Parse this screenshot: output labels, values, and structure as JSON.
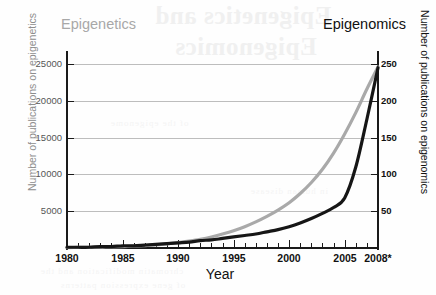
{
  "series_titles": {
    "left": "Epigenetics",
    "right": "Epigenomics"
  },
  "background_bleed": {
    "line1": "Epigenetics and",
    "line2": "Epigenomics",
    "smudge1": "of the epigenome",
    "smudge2": "in human disease",
    "bottom1": "chromatin modification and the",
    "bottom2": "of gene expression patterns"
  },
  "chart_data": {
    "type": "line",
    "title": "",
    "xlabel": "Year",
    "ylabel_left": "Number of publications on epigenetics",
    "ylabel_right": "Number of publications on epigenomics",
    "xlim": [
      1980,
      2008
    ],
    "ylim_left": [
      0,
      26500
    ],
    "ylim_right": [
      0,
      265
    ],
    "grid": true,
    "legend_position": "top-inline",
    "x_major_ticks": [
      1980,
      1985,
      1990,
      1995,
      2000,
      2005,
      2008
    ],
    "x_tick_labels": [
      "1980",
      "1985",
      "1990",
      "1995",
      "2000",
      "2005",
      "2008*"
    ],
    "x_minor_tick_step": 1,
    "y_left_ticks": [
      5000,
      10000,
      15000,
      20000,
      25000
    ],
    "y_left_tick_labels": [
      "5000",
      "10000",
      "15000",
      "20000",
      "25000"
    ],
    "y_right_ticks": [
      50,
      100,
      150,
      200,
      250
    ],
    "y_right_tick_labels": [
      "50",
      "100",
      "150",
      "200",
      "250"
    ],
    "x": [
      1980,
      1981,
      1982,
      1983,
      1984,
      1985,
      1986,
      1987,
      1988,
      1989,
      1990,
      1991,
      1992,
      1993,
      1994,
      1995,
      1996,
      1997,
      1998,
      1999,
      2000,
      2001,
      2002,
      2003,
      2004,
      2005,
      2006,
      2007,
      2008
    ],
    "series": [
      {
        "name": "Epigenetics",
        "axis": "left",
        "color": "#a9a9a9",
        "values": [
          60,
          75,
          95,
          120,
          150,
          190,
          250,
          330,
          430,
          560,
          720,
          930,
          1180,
          1500,
          1900,
          2350,
          2900,
          3550,
          4300,
          5150,
          6150,
          7400,
          8900,
          10700,
          12900,
          15500,
          18400,
          21600,
          24600
        ]
      },
      {
        "name": "Epigenomics",
        "axis": "right",
        "color": "#161616",
        "values": [
          1,
          1,
          1,
          2,
          2,
          3,
          3,
          4,
          5,
          6,
          7,
          8,
          10,
          11,
          13,
          15,
          17,
          19,
          22,
          25,
          29,
          34,
          40,
          47,
          55,
          68,
          110,
          175,
          245
        ]
      }
    ],
    "footnote_marker": "*"
  }
}
